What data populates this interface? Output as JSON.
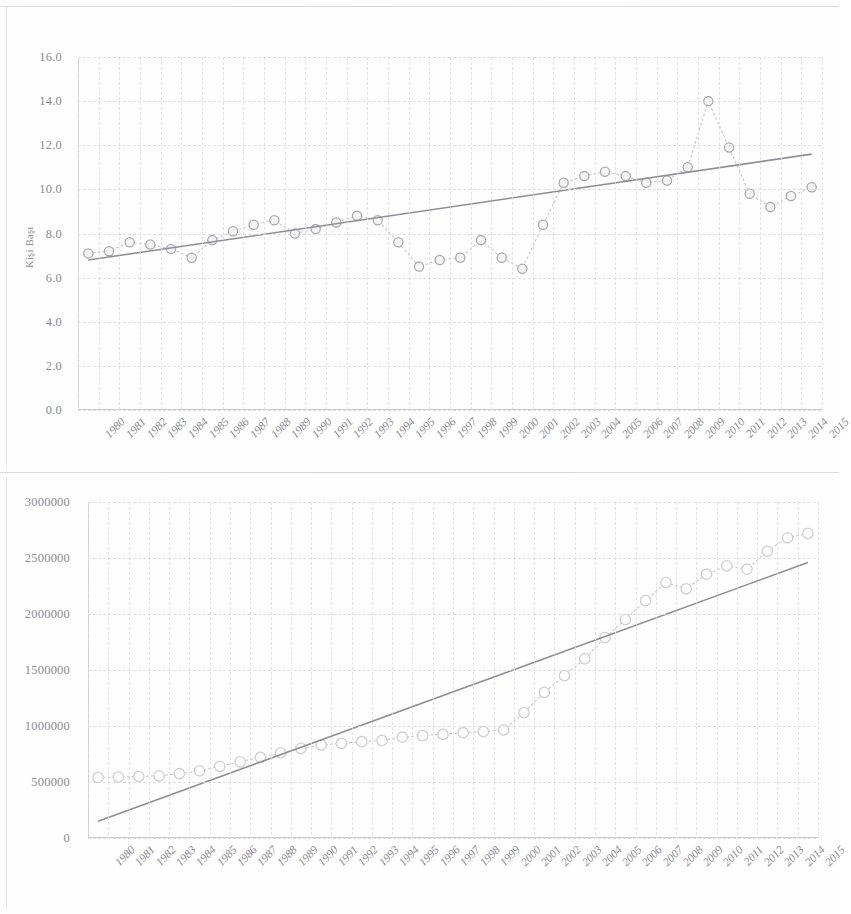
{
  "page": {
    "background": "#fefefe",
    "ink": "#8b8b91"
  },
  "chart_data": [
    {
      "type": "line",
      "title": "",
      "subtitle": "",
      "xlabel": "",
      "ylabel": "Kişi Başı",
      "ylim": [
        0,
        16
      ],
      "ytick_labels": [
        "0.0",
        "2.0",
        "4.0",
        "6.0",
        "8.0",
        "10.0",
        "12.0",
        "14.0",
        "16.0"
      ],
      "ytick_values": [
        0,
        2,
        4,
        6,
        8,
        10,
        12,
        14,
        16
      ],
      "grid": true,
      "legend": "none",
      "categories": [
        "1980",
        "1981",
        "1982",
        "1983",
        "1984",
        "1985",
        "1986",
        "1987",
        "1988",
        "1989",
        "1990",
        "1991",
        "1992",
        "1993",
        "1994",
        "1995",
        "1996",
        "1997",
        "1998",
        "1999",
        "2000",
        "2001",
        "2002",
        "2003",
        "2004",
        "2005",
        "2006",
        "2007",
        "2008",
        "2009",
        "2010",
        "2011",
        "2012",
        "2013",
        "2014",
        "2015"
      ],
      "series": [
        {
          "name": "Kişi Başı",
          "marker": "circle",
          "values": [
            7.1,
            7.2,
            7.6,
            7.5,
            7.3,
            6.9,
            7.7,
            8.1,
            8.4,
            8.6,
            8.0,
            8.2,
            8.5,
            8.8,
            8.6,
            7.6,
            6.5,
            6.8,
            6.9,
            7.7,
            6.9,
            6.4,
            8.4,
            10.3,
            10.6,
            10.8,
            10.6,
            10.3,
            10.4,
            11.0,
            14.0,
            11.9,
            9.8,
            9.2,
            9.7,
            10.1,
            11.6
          ]
        },
        {
          "name": "Doğrusal (Kişi Başı)",
          "type": "trend",
          "endpoints": [
            6.8,
            11.6
          ]
        }
      ]
    },
    {
      "type": "line",
      "title": "",
      "subtitle": "",
      "xlabel": "",
      "ylabel": "",
      "ylim": [
        0,
        3000000
      ],
      "ytick_labels": [
        "0",
        "500000",
        "1000000",
        "1500000",
        "2000000",
        "2500000",
        "3000000"
      ],
      "ytick_values": [
        0,
        500000,
        1000000,
        1500000,
        2000000,
        2500000,
        3000000
      ],
      "grid": true,
      "legend": "none",
      "categories": [
        "1980",
        "1981",
        "1982",
        "1983",
        "1984",
        "1985",
        "1986",
        "1987",
        "1988",
        "1989",
        "1990",
        "1991",
        "1992",
        "1993",
        "1994",
        "1995",
        "1996",
        "1997",
        "1998",
        "1999",
        "2000",
        "2001",
        "2002",
        "2003",
        "2004",
        "2005",
        "2006",
        "2007",
        "2008",
        "2009",
        "2010",
        "2011",
        "2012",
        "2013",
        "2014",
        "2015"
      ],
      "series": [
        {
          "name": "Toplam",
          "marker": "circle",
          "values": [
            540000,
            545000,
            550000,
            555000,
            575000,
            600000,
            640000,
            680000,
            720000,
            760000,
            800000,
            830000,
            845000,
            860000,
            870000,
            900000,
            915000,
            925000,
            940000,
            950000,
            965000,
            1120000,
            1300000,
            1450000,
            1600000,
            1790000,
            1950000,
            2120000,
            2280000,
            2225000,
            2355000,
            2430000,
            2400000,
            2560000,
            2680000,
            2720000
          ]
        },
        {
          "name": "Doğrusal (Toplam)",
          "type": "trend",
          "endpoints": [
            150000,
            2460000
          ]
        }
      ]
    }
  ]
}
